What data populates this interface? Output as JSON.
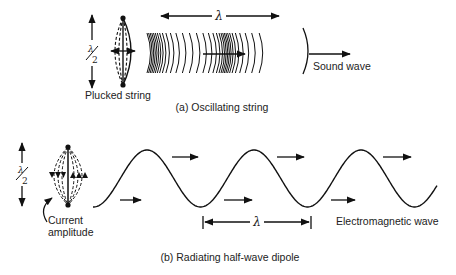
{
  "figure": {
    "panel_a": {
      "caption": "(a) Oscillating string",
      "source_label": "Plucked string",
      "wave_label": "Sound wave",
      "wavelength_symbol": "λ",
      "half_wavelength_numerator": "λ",
      "half_wavelength_denominator": "2"
    },
    "panel_b": {
      "caption": "(b) Radiating half-wave dipole",
      "source_label_line1": "Current",
      "source_label_line2": "amplitude",
      "wave_label": "Electromagnetic wave",
      "wavelength_symbol": "λ",
      "half_wavelength_numerator": "λ",
      "half_wavelength_denominator": "2"
    }
  }
}
